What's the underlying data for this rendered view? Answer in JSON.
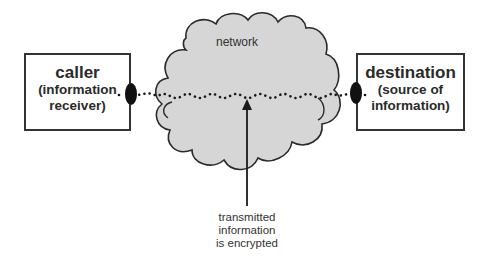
{
  "diagram": {
    "type": "network-encryption-flow",
    "nodes": {
      "caller": {
        "title": "caller",
        "subtitle_line1": "(information",
        "subtitle_line2": "receiver)"
      },
      "network": {
        "label": "network",
        "shape": "cloud"
      },
      "destination": {
        "title": "destination",
        "subtitle_line1": "(source of",
        "subtitle_line2": "information)"
      }
    },
    "connection": {
      "style": "dotted-wavy",
      "from": "caller",
      "to": "destination",
      "endpoints": "black-ellipse"
    },
    "annotation": {
      "line1": "transmitted",
      "line2": "information",
      "line3": "is encrypted",
      "points_to": "connection"
    },
    "colors": {
      "cloud_fill": "#d6d6d6",
      "outline": "#2a2a2a",
      "box_fill": "#ffffff",
      "endpoint": "#111111"
    }
  }
}
